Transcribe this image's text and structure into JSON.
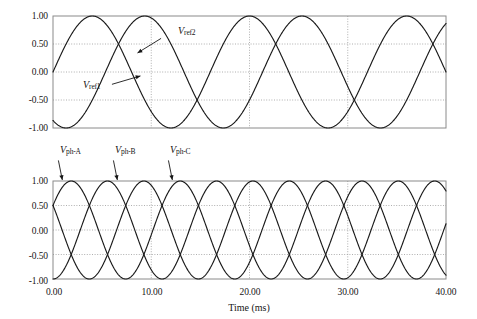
{
  "figure": {
    "xlabel": "Time (ms)",
    "panels": [
      "reference-waveforms",
      "phase-waveforms"
    ]
  },
  "chart_data": [
    {
      "type": "line",
      "title": "",
      "xlabel": "",
      "ylabel": "",
      "xlim": [
        0,
        40
      ],
      "ylim": [
        -1.0,
        1.0
      ],
      "xticks": [
        0.0,
        10.0,
        20.0,
        30.0,
        40.0
      ],
      "xticklabels": [
        "0.00",
        "10.00",
        "20.00",
        "30.00",
        "40.00"
      ],
      "yticks": [
        -1.0,
        -0.5,
        0.0,
        0.5,
        1.0
      ],
      "yticklabels": [
        "-1.00",
        "-0.50",
        "0.00",
        "0.50",
        "1.00"
      ],
      "grid": true,
      "legend": "annotated-inline",
      "series": [
        {
          "name": "V_ref1",
          "label": "Vref1",
          "amplitude": 1.0,
          "period_ms": 16.0,
          "phase_deg": -120,
          "start_value": -0.87,
          "color": "#1a1a1a"
        },
        {
          "name": "V_ref2",
          "label": "Vref2",
          "amplitude": 1.0,
          "period_ms": 16.0,
          "phase_deg": 0,
          "start_value": 0.0,
          "color": "#1a1a1a"
        }
      ],
      "annotations": [
        {
          "text": "Vref2",
          "sub": "ref2",
          "x_ms": 11.5,
          "y": 0.62,
          "arrow_to_x_ms": 9.2,
          "arrow_to_y": 0.38
        },
        {
          "text": "Vref1",
          "sub": "ref1",
          "x_ms": 3.0,
          "y": -0.28,
          "arrow_to_x_ms": 6.4,
          "arrow_to_y": -0.12
        }
      ]
    },
    {
      "type": "line",
      "title": "",
      "xlabel": "Time (ms)",
      "ylabel": "",
      "xlim": [
        0,
        40
      ],
      "ylim": [
        -1.0,
        1.0
      ],
      "xticks": [
        0.0,
        10.0,
        20.0,
        30.0,
        40.0
      ],
      "xticklabels": [
        "0.00",
        "10.00",
        "20.00",
        "30.00",
        "40.00"
      ],
      "yticks": [
        -1.0,
        -0.5,
        0.0,
        0.5,
        1.0
      ],
      "yticklabels": [
        "-1.00",
        "-0.50",
        "0.00",
        "0.50",
        "1.00"
      ],
      "grid": true,
      "legend": "annotated-inline",
      "series": [
        {
          "name": "V_ph-A",
          "label": "Vph-A",
          "amplitude": 1.0,
          "period_ms": 11.1,
          "phase_deg": 30,
          "start_value": 0.5,
          "color": "#1a1a1a"
        },
        {
          "name": "V_ph-B",
          "label": "Vph-B",
          "amplitude": 1.0,
          "period_ms": 11.1,
          "phase_deg": 270,
          "start_value": -1.0,
          "color": "#1a1a1a"
        },
        {
          "name": "V_ph-C",
          "label": "Vph-C",
          "amplitude": 1.0,
          "period_ms": 11.1,
          "phase_deg": 150,
          "start_value": 0.5,
          "color": "#1a1a1a"
        }
      ],
      "annotations": [
        {
          "text": "Vph-A",
          "sub": "ph-A",
          "x_ms": 1.4,
          "y": 1.34,
          "arrow_to_x_ms": 0.9,
          "arrow_to_y": 0.98
        },
        {
          "text": "Vph-B",
          "sub": "ph-B",
          "x_ms": 7.0,
          "y": 1.34,
          "arrow_to_x_ms": 6.4,
          "arrow_to_y": 0.98
        },
        {
          "text": "Vph-C",
          "sub": "ph-C",
          "x_ms": 12.6,
          "y": 1.34,
          "arrow_to_x_ms": 12.0,
          "arrow_to_y": 0.98
        }
      ]
    }
  ],
  "ticks": {
    "y": [
      "1.00",
      "0.50",
      "0.00",
      "-0.50",
      "-1.00"
    ],
    "x": [
      "0.00",
      "10.00",
      "20.00",
      "30.00",
      "40.00"
    ]
  },
  "labels": {
    "vref1": "V",
    "vref1_sub": "ref1",
    "vref2": "V",
    "vref2_sub": "ref2",
    "vpha": "V",
    "vpha_sub": "ph-A",
    "vphb": "V",
    "vphb_sub": "ph-B",
    "vphc": "V",
    "vphc_sub": "ph-C",
    "time_axis": "Time (ms)"
  },
  "colors": {
    "curve": "#1a1a1a",
    "frame": "#8a8a8a",
    "grid": "#9a9a9a",
    "text": "#161616"
  }
}
